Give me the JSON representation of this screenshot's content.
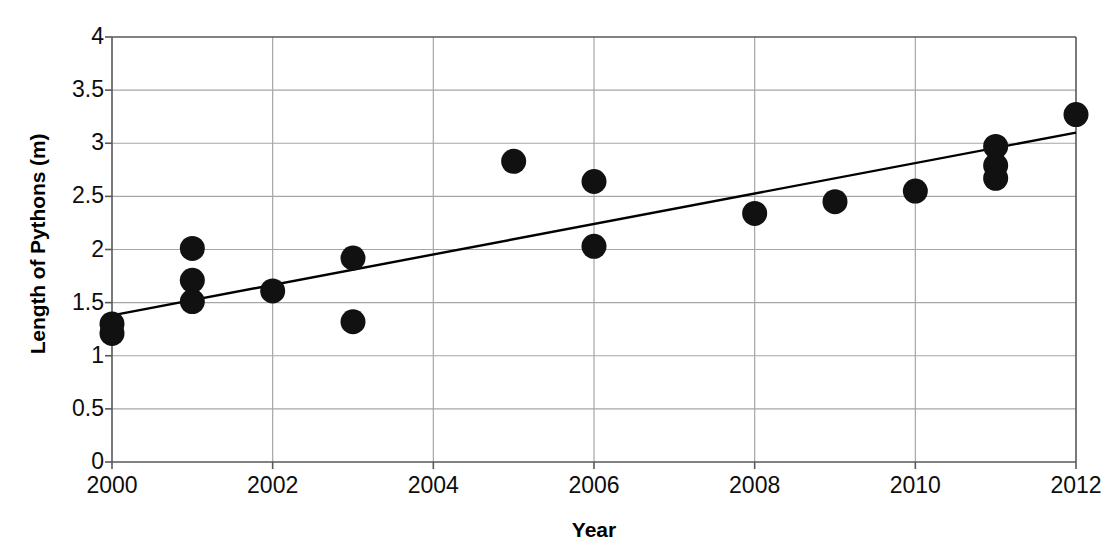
{
  "chart_data": {
    "type": "scatter",
    "title": "",
    "xlabel": "Year",
    "ylabel": "Length of Pythons (m)",
    "xlim": [
      2000,
      2012
    ],
    "ylim": [
      0,
      4
    ],
    "xticks": [
      2000,
      2002,
      2004,
      2006,
      2008,
      2010,
      2012
    ],
    "xtick_labels": [
      "2000",
      "2002",
      "2004",
      "2006",
      "2008",
      "2010",
      "2012"
    ],
    "yticks": [
      0,
      0.5,
      1,
      1.5,
      2,
      2.5,
      3,
      3.5,
      4
    ],
    "ytick_labels": [
      "0",
      "0.5",
      "1",
      "1.5",
      "2",
      "2.5",
      "3",
      "3.5",
      "4"
    ],
    "grid": true,
    "grid_color": "#a6a6a6",
    "legend": false,
    "marker_color": "#111111",
    "marker_shape": "circle",
    "trendline_color": "#000000",
    "series": [
      {
        "name": "Length of Pythons (m)",
        "points": [
          {
            "x": 2000,
            "y": 1.3
          },
          {
            "x": 2000,
            "y": 1.21
          },
          {
            "x": 2001,
            "y": 2.01
          },
          {
            "x": 2001,
            "y": 1.71
          },
          {
            "x": 2001,
            "y": 1.51
          },
          {
            "x": 2002,
            "y": 1.61
          },
          {
            "x": 2003,
            "y": 1.92
          },
          {
            "x": 2003,
            "y": 1.32
          },
          {
            "x": 2005,
            "y": 2.83
          },
          {
            "x": 2006,
            "y": 2.64
          },
          {
            "x": 2006,
            "y": 2.03
          },
          {
            "x": 2008,
            "y": 2.34
          },
          {
            "x": 2009,
            "y": 2.45
          },
          {
            "x": 2010,
            "y": 2.55
          },
          {
            "x": 2011,
            "y": 2.97
          },
          {
            "x": 2011,
            "y": 2.79
          },
          {
            "x": 2011,
            "y": 2.67
          },
          {
            "x": 2012,
            "y": 3.27
          }
        ]
      }
    ],
    "trendline": {
      "name": "linear-trendline",
      "x_start": 2000,
      "y_start": 1.38,
      "x_end": 2012,
      "y_end": 3.1
    }
  }
}
